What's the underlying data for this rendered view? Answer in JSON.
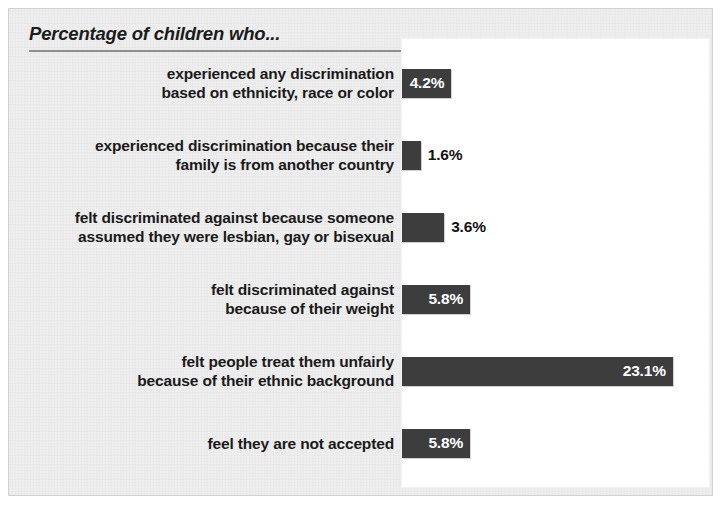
{
  "chart_data": {
    "type": "bar",
    "orientation": "horizontal",
    "title": "Percentage of children who...",
    "xlabel": "",
    "ylabel": "",
    "xlim": [
      0,
      26
    ],
    "grid": false,
    "legend": null,
    "value_suffix": "%",
    "categories": [
      "experienced any discrimination\nbased on ethnicity, race or color",
      "experienced discrimination because their\nfamily is from another country",
      "felt discriminated against because someone\nassumed they were lesbian, gay or bisexual",
      "felt discriminated against\nbecause of their weight",
      "felt people treat them unfairly\nbecause of their ethnic background",
      "feel they are not accepted"
    ],
    "values": [
      4.2,
      1.6,
      3.6,
      5.8,
      23.1,
      5.8
    ],
    "value_labels": [
      "4.2%",
      "1.6%",
      "3.6%",
      "5.8%",
      "23.1%",
      "5.8%"
    ],
    "label_placement": [
      "inside",
      "outside",
      "outside",
      "inside",
      "inside",
      "inside"
    ],
    "bars": [
      {
        "category": "experienced any discrimination\nbased on ethnicity, race or color",
        "value": 4.2,
        "label": "4.2%",
        "placement": "inside"
      },
      {
        "category": "experienced discrimination because their\nfamily is from another country",
        "value": 1.6,
        "label": "1.6%",
        "placement": "outside"
      },
      {
        "category": "felt discriminated against because someone\nassumed they were lesbian, gay or bisexual",
        "value": 3.6,
        "label": "3.6%",
        "placement": "outside"
      },
      {
        "category": "felt discriminated against\nbecause of their weight",
        "value": 5.8,
        "label": "5.8%",
        "placement": "inside"
      },
      {
        "category": "felt people treat them unfairly\nbecause of their ethnic background",
        "value": 23.1,
        "label": "23.1%",
        "placement": "inside"
      },
      {
        "category": "feel they are not accepted",
        "value": 5.8,
        "label": "5.8%",
        "placement": "inside"
      }
    ],
    "colors": {
      "bar": "#3d3d3d",
      "bar_label_inside": "#ffffff",
      "bar_label_outside": "#111111",
      "category_label": "#1a1a1a",
      "plot_background": "#ffffff",
      "card_background": "#eeeeee",
      "title_rule": "#8e8e8e",
      "card_border": "#d2d2d2"
    }
  }
}
